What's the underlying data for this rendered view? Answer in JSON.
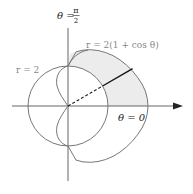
{
  "figure": {
    "type": "polar-diagram",
    "labels": {
      "theta_pi_over_2": "θ = π/2",
      "theta_pi_over_2_lhs": "θ =",
      "theta_pi_over_2_num": "π",
      "theta_pi_over_2_den": "2",
      "cardioid": "r = 2(1 + cos θ)",
      "circle": "r = 2",
      "theta_zero": "θ = 0"
    },
    "curves": [
      {
        "name": "circle",
        "equation": "r = 2",
        "color": "#777777"
      },
      {
        "name": "cardioid",
        "equation": "r = 2(1 + cos θ)",
        "color": "#777777"
      }
    ],
    "shaded_region": {
      "description": "region inside cardioid and outside circle, 0 ≤ θ ≤ π/2",
      "fill": "#ececec"
    },
    "radial_segment": {
      "angle": "θ ≈ π/6",
      "dashed_part": "origin to circle",
      "solid_part": "circle to cardioid"
    },
    "colors": {
      "axes": "#555555",
      "curves": "#777777",
      "label_gray": "#888888",
      "label_black": "#222222",
      "shade": "#ececec"
    }
  }
}
